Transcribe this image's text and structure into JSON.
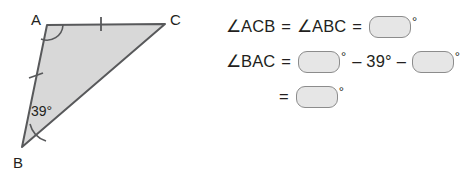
{
  "figure": {
    "shape": "triangle",
    "fill_color": "#d8d8d8",
    "stroke_color": "#58595b",
    "vertices": {
      "a_label": "A",
      "b_label": "B",
      "c_label": "C"
    },
    "angle_label_b": "39°",
    "tick_marks": 2,
    "angle_arcs": [
      "A",
      "B"
    ]
  },
  "equations": {
    "line1": {
      "lhs": "∠ACB",
      "equals_1": "=",
      "rhs": "∠ABC",
      "equals_2": "=",
      "blank_value": "",
      "degree": "°"
    },
    "line2": {
      "lhs": "∠BAC",
      "equals": "=",
      "blank1_value": "",
      "degree1": "°",
      "minus1": "–",
      "known_angle": "39",
      "degree_known": "°",
      "minus2": "–",
      "blank2_value": "",
      "degree2": "°"
    },
    "line3": {
      "equals": "=",
      "blank_value": "",
      "degree": "°"
    }
  }
}
